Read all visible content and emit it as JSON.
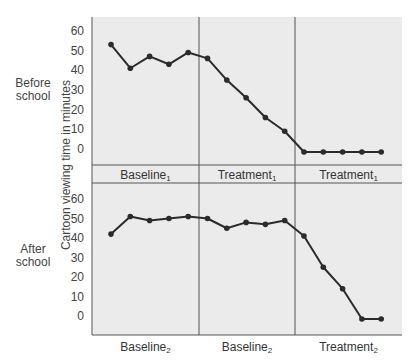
{
  "chart_data": [
    {
      "type": "line",
      "title": "Before school",
      "ylabel": "Cartoon viewing time in minutes",
      "ylim": [
        0,
        60
      ],
      "yticks": [
        0,
        10,
        20,
        30,
        40,
        50,
        60
      ],
      "phases": [
        {
          "label": "Baseline",
          "sub": "1",
          "sessions": [
            1,
            6
          ]
        },
        {
          "label": "Treatment",
          "sub": "1",
          "sessions": [
            6,
            11
          ]
        },
        {
          "label": "Treatment",
          "sub": "1",
          "sessions": [
            11,
            15
          ]
        }
      ],
      "x": [
        1,
        2,
        3,
        4,
        5,
        6,
        7,
        8,
        9,
        10,
        11,
        12,
        13,
        14,
        15
      ],
      "values": [
        53,
        41,
        47,
        43,
        49,
        46,
        35,
        26,
        16,
        9,
        0,
        0,
        0,
        0,
        0
      ]
    },
    {
      "type": "line",
      "title": "After school",
      "ylabel": "Cartoon viewing time in minutes",
      "ylim": [
        0,
        60
      ],
      "yticks": [
        0,
        10,
        20,
        30,
        40,
        50,
        60
      ],
      "phases": [
        {
          "label": "Baseline",
          "sub": "2",
          "sessions": [
            1,
            6
          ]
        },
        {
          "label": "Baseline",
          "sub": "2",
          "sessions": [
            6,
            11
          ]
        },
        {
          "label": "Treatment",
          "sub": "2",
          "sessions": [
            11,
            15
          ]
        }
      ],
      "x": [
        1,
        2,
        3,
        4,
        5,
        6,
        7,
        8,
        9,
        10,
        11,
        12,
        13,
        14,
        15
      ],
      "values": [
        42,
        51,
        49,
        50,
        51,
        50,
        45,
        48,
        47,
        49,
        41,
        25,
        14,
        0,
        0
      ]
    }
  ],
  "labels": {
    "before_school": "Before school",
    "after_school": "After school",
    "ylabel": "Cartoon viewing time in minutes",
    "top_phases": [
      {
        "name": "Baseline",
        "sub": "1"
      },
      {
        "name": "Treatment",
        "sub": "1"
      },
      {
        "name": "Treatment",
        "sub": "1"
      }
    ],
    "bottom_phases": [
      {
        "name": "Baseline",
        "sub": "2"
      },
      {
        "name": "Baseline",
        "sub": "2"
      },
      {
        "name": "Treatment",
        "sub": "2"
      }
    ],
    "ticks": [
      "60",
      "50",
      "40",
      "30",
      "20",
      "10",
      "0"
    ]
  },
  "colors": {
    "panel": "#ebebeb",
    "line": "#2b2b2b",
    "frame": "#555555"
  }
}
